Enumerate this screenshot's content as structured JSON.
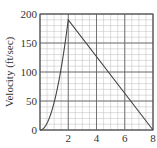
{
  "chart_data": {
    "type": "line",
    "title": "",
    "xlabel": "",
    "ylabel": "Velocity (ft/sec)",
    "xlim": [
      0,
      8
    ],
    "ylim": [
      0,
      200
    ],
    "x_ticks": [
      "0",
      "2",
      "4",
      "6",
      "8"
    ],
    "y_ticks": [
      "0",
      "50",
      "100",
      "150",
      "200"
    ],
    "grid": true,
    "minor_grid": {
      "x_step": 0.5,
      "y_step": 10
    },
    "series": [
      {
        "name": "velocity",
        "segments": [
          {
            "shape": "curve (accelerating, concave up)",
            "x": [
              0,
              0.5,
              1,
              1.5,
              2
            ],
            "y": [
              0,
              12,
              48,
              107,
              190
            ]
          },
          {
            "shape": "linear decrease",
            "x": [
              2,
              8
            ],
            "y": [
              190,
              0
            ]
          }
        ]
      }
    ]
  }
}
